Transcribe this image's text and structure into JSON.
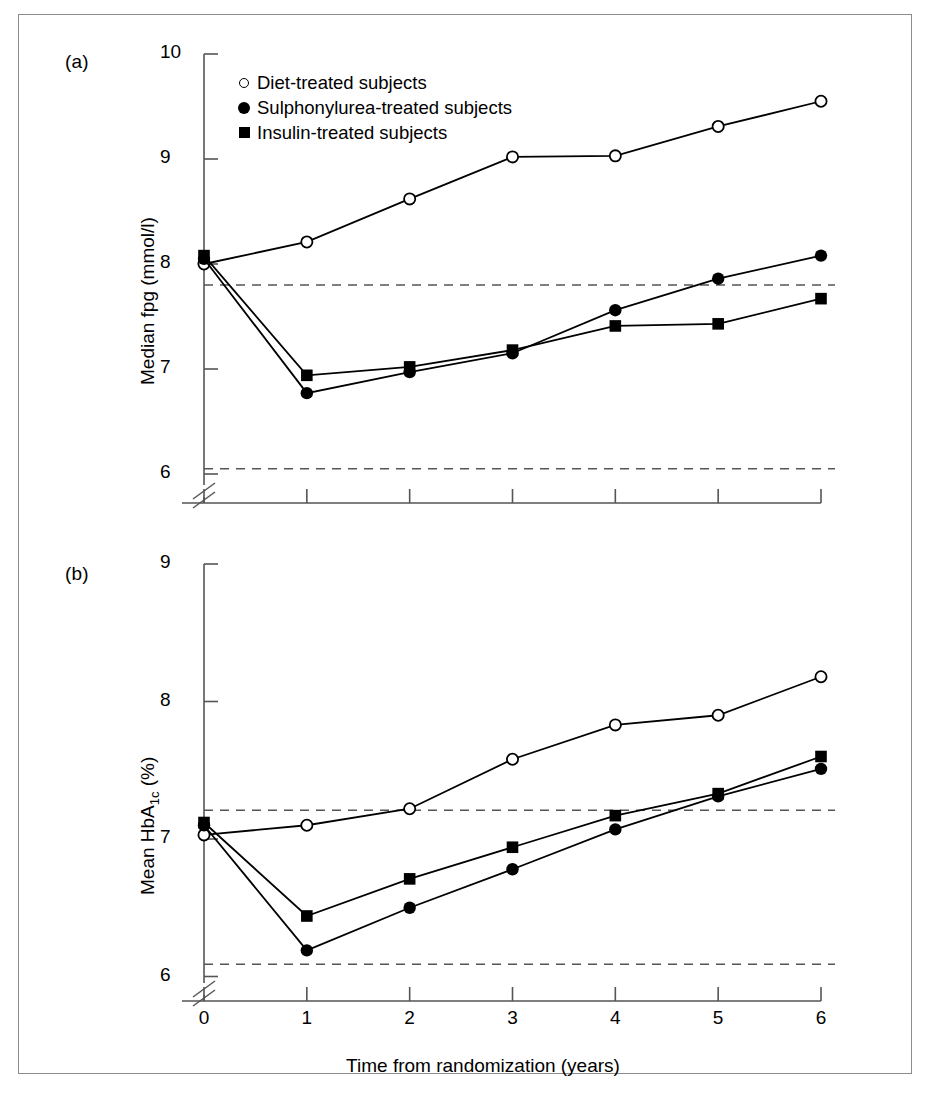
{
  "figure": {
    "panel_a_label": "(a)",
    "panel_b_label": "(b)",
    "xlabel": "Time from randomization (years)"
  },
  "legend": {
    "items": [
      {
        "marker": "open-circle-marker",
        "label": "Diet-treated subjects"
      },
      {
        "marker": "filled-circle-marker",
        "label": "Sulphonylurea-treated subjects"
      },
      {
        "marker": "filled-square-marker",
        "label": "Insulin-treated subjects"
      }
    ]
  },
  "axis_a": {
    "ylabel": "Median fpg (mmol/l)",
    "yticks": [
      "10",
      "9",
      "8",
      "7",
      "6"
    ],
    "xticks": [
      "0",
      "1",
      "2",
      "3",
      "4",
      "5",
      "6"
    ]
  },
  "axis_b": {
    "ylabel": "Mean HbA1c (%)",
    "ylabel_main": "Mean HbA",
    "ylabel_sub": "1c",
    "ylabel_unit": " (%)",
    "yticks": [
      "9",
      "8",
      "7",
      "6"
    ],
    "xticks": [
      "0",
      "1",
      "2",
      "3",
      "4",
      "5",
      "6"
    ]
  },
  "chart_data": [
    {
      "id": "panel-a",
      "type": "line",
      "title": "(a)",
      "xlabel": "Time from randomization (years)",
      "ylabel": "Median fpg (mmol/l)",
      "x": [
        0,
        1,
        2,
        3,
        4,
        5,
        6
      ],
      "xlim": [
        0,
        6
      ],
      "ylim": [
        6,
        10
      ],
      "yticks": [
        6,
        7,
        8,
        9,
        10
      ],
      "axis_break": true,
      "grid": false,
      "legend_position": "top-left-inside",
      "reference_lines": [
        {
          "value": 7.8,
          "style": "dashed",
          "label": "upper reference"
        },
        {
          "value": 6.05,
          "style": "dashed",
          "label": "lower reference"
        }
      ],
      "series": [
        {
          "name": "Diet-treated subjects",
          "marker": "open-circle",
          "values": [
            8.0,
            8.21,
            8.62,
            9.02,
            9.03,
            9.31,
            9.55
          ]
        },
        {
          "name": "Sulphonylurea-treated subjects",
          "marker": "filled-circle",
          "values": [
            8.05,
            6.77,
            6.97,
            7.15,
            7.56,
            7.86,
            8.08
          ]
        },
        {
          "name": "Insulin-treated subjects",
          "marker": "filled-square",
          "values": [
            8.08,
            6.94,
            7.02,
            7.18,
            7.41,
            7.43,
            7.67
          ]
        }
      ]
    },
    {
      "id": "panel-b",
      "type": "line",
      "title": "(b)",
      "xlabel": "Time from randomization (years)",
      "ylabel": "Mean HbA1c (%)",
      "x": [
        0,
        1,
        2,
        3,
        4,
        5,
        6
      ],
      "xlim": [
        0,
        6
      ],
      "ylim": [
        6,
        9
      ],
      "yticks": [
        6,
        7,
        8,
        9
      ],
      "axis_break": true,
      "grid": false,
      "legend_position": "none",
      "reference_lines": [
        {
          "value": 7.21,
          "style": "dashed",
          "label": "upper reference"
        },
        {
          "value": 6.09,
          "style": "dashed",
          "label": "lower reference"
        }
      ],
      "series": [
        {
          "name": "Diet-treated subjects",
          "marker": "open-circle",
          "values": [
            7.03,
            7.1,
            7.22,
            7.58,
            7.83,
            7.9,
            8.18
          ]
        },
        {
          "name": "Sulphonylurea-treated subjects",
          "marker": "filled-circle",
          "values": [
            7.1,
            6.19,
            6.5,
            6.78,
            7.07,
            7.31,
            7.51
          ]
        },
        {
          "name": "Insulin-treated subjects",
          "marker": "filled-square",
          "values": [
            7.12,
            6.44,
            6.71,
            6.94,
            7.17,
            7.33,
            7.6
          ]
        }
      ]
    }
  ]
}
